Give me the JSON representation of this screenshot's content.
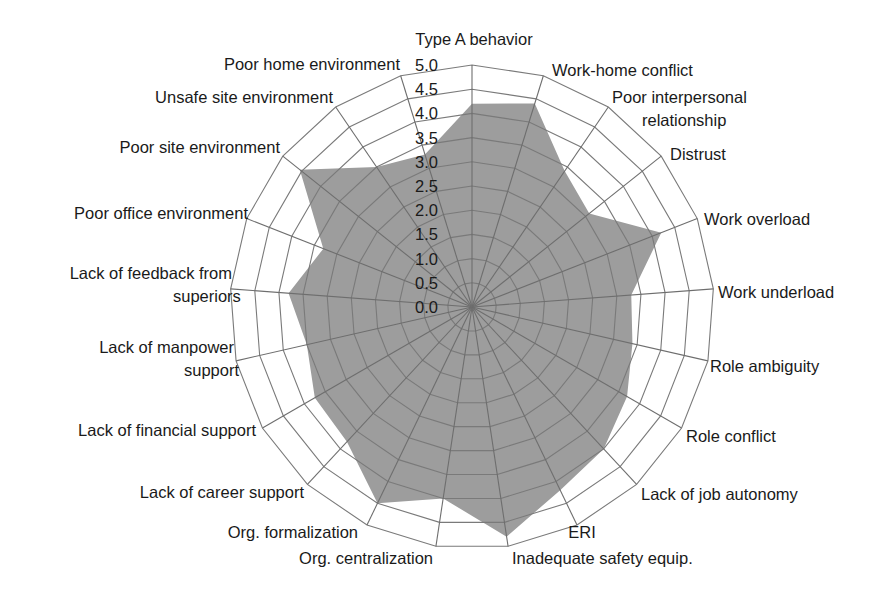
{
  "chart_data": {
    "type": "radar",
    "title": "",
    "series": [
      {
        "name": "Mean score",
        "color": "#9d9d9d",
        "values": [
          4.2,
          4.4,
          3.4,
          3.1,
          4.2,
          3.3,
          3.4,
          3.7,
          4.0,
          4.2,
          4.8,
          4.0,
          4.5,
          3.8,
          3.75,
          3.5,
          3.8,
          3.3,
          4.55,
          3.5,
          3.3
        ]
      }
    ],
    "categories": [
      "Type A behavior",
      "Work-home conflict",
      "Poor interpersonal relationship",
      "Distrust",
      "Work overload",
      "Work underload",
      "Role ambiguity",
      "Role conflict",
      "Lack of job autonomy",
      "ERI",
      "Inadequate safety equip.",
      "Org. centralization",
      "Org. formalization",
      "Lack of career support",
      "Lack of financial support",
      "Lack of manpower support",
      "Lack of feedback from superiors",
      "Poor office environment",
      "Poor site environment",
      "Unsafe site environment",
      "Poor home environment"
    ],
    "radial_ticks": [
      "0.0",
      "0.5",
      "1.0",
      "1.5",
      "2.0",
      "2.5",
      "3.0",
      "3.5",
      "4.0",
      "4.5",
      "5.0"
    ],
    "rlim": [
      0,
      5
    ],
    "grid": true,
    "legend": "none"
  },
  "layout": {
    "center_x": 472,
    "center_y": 307,
    "radius": 242,
    "labels": [
      {
        "lines": [
          "Type A behavior"
        ],
        "x": 474,
        "y": 45,
        "anchor": "middle"
      },
      {
        "lines": [
          "Work-home conflict"
        ],
        "x": 552,
        "y": 76,
        "anchor": "start"
      },
      {
        "lines": [
          "Poor interpersonal",
          "relationship"
        ],
        "x": 612,
        "y": 103,
        "anchor": "start",
        "line2_x": 642
      },
      {
        "lines": [
          "Distrust"
        ],
        "x": 670,
        "y": 160,
        "anchor": "start"
      },
      {
        "lines": [
          "Work overload"
        ],
        "x": 704,
        "y": 225,
        "anchor": "start"
      },
      {
        "lines": [
          "Work underload"
        ],
        "x": 718,
        "y": 298,
        "anchor": "start"
      },
      {
        "lines": [
          "Role ambiguity"
        ],
        "x": 710,
        "y": 372,
        "anchor": "start"
      },
      {
        "lines": [
          "Role conflict"
        ],
        "x": 686,
        "y": 442,
        "anchor": "start"
      },
      {
        "lines": [
          "Lack of job autonomy"
        ],
        "x": 641,
        "y": 500,
        "anchor": "start"
      },
      {
        "lines": [
          "ERI"
        ],
        "x": 582,
        "y": 538,
        "anchor": "middle"
      },
      {
        "lines": [
          "Inadequate  safety equip."
        ],
        "x": 512,
        "y": 564,
        "anchor": "start"
      },
      {
        "lines": [
          "Org. centralization"
        ],
        "x": 433,
        "y": 564,
        "anchor": "end"
      },
      {
        "lines": [
          "Org. formalization"
        ],
        "x": 358,
        "y": 538,
        "anchor": "end"
      },
      {
        "lines": [
          "Lack of career support"
        ],
        "x": 304,
        "y": 498,
        "anchor": "end"
      },
      {
        "lines": [
          "Lack of financial support"
        ],
        "x": 256,
        "y": 436,
        "anchor": "end"
      },
      {
        "lines": [
          "Lack of manpower",
          "support"
        ],
        "x": 234,
        "y": 353,
        "anchor": "end",
        "line2_x": 184
      },
      {
        "lines": [
          "Lack of feedback from",
          "superiors"
        ],
        "x": 232,
        "y": 279,
        "anchor": "end",
        "line2_x": 173
      },
      {
        "lines": [
          "Poor office environment"
        ],
        "x": 248,
        "y": 219,
        "anchor": "end"
      },
      {
        "lines": [
          "Poor site environment"
        ],
        "x": 280,
        "y": 153,
        "anchor": "end"
      },
      {
        "lines": [
          "Unsafe site environment"
        ],
        "x": 333,
        "y": 103,
        "anchor": "end"
      },
      {
        "lines": [
          "Poor home environment"
        ],
        "x": 400,
        "y": 70,
        "anchor": "end"
      }
    ],
    "tick_label_x": 438
  }
}
